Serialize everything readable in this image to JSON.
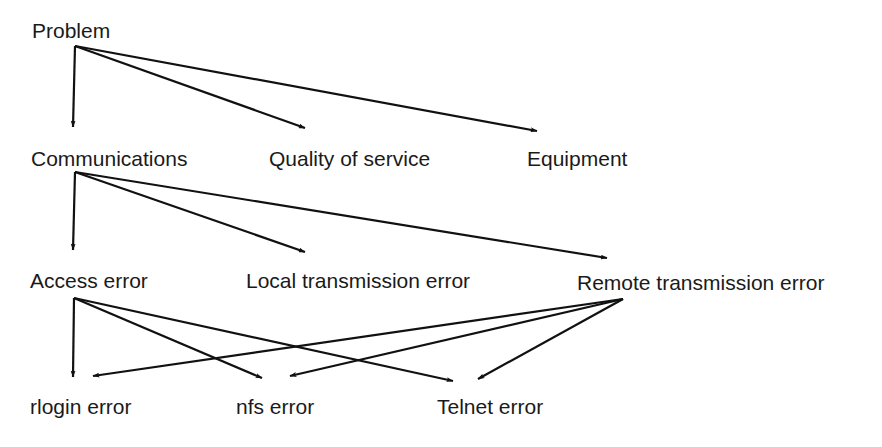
{
  "diagram": {
    "type": "hierarchy",
    "colors": {
      "background": "#ffffff",
      "line": "#111111",
      "text": "#1a1a1a"
    },
    "nodes": [
      {
        "id": "problem",
        "label": "Problem",
        "x": 32,
        "y": 20
      },
      {
        "id": "communications",
        "label": "Communications",
        "x": 31,
        "y": 148
      },
      {
        "id": "quality",
        "label": "Quality of service",
        "x": 269,
        "y": 148
      },
      {
        "id": "equipment",
        "label": "Equipment",
        "x": 527,
        "y": 148
      },
      {
        "id": "access",
        "label": "Access error",
        "x": 30,
        "y": 270
      },
      {
        "id": "local",
        "label": "Local transmission error",
        "x": 246,
        "y": 270
      },
      {
        "id": "remote",
        "label": "Remote transmission error",
        "x": 577,
        "y": 272
      },
      {
        "id": "rlogin",
        "label": "rlogin error",
        "x": 30,
        "y": 396
      },
      {
        "id": "nfs",
        "label": "nfs error",
        "x": 236,
        "y": 396
      },
      {
        "id": "telnet",
        "label": "Telnet error",
        "x": 437,
        "y": 396
      }
    ],
    "edges": [
      {
        "from": "problem",
        "to": "communications",
        "x1": 75,
        "y1": 46,
        "x2": 73,
        "y2": 127
      },
      {
        "from": "problem",
        "to": "quality",
        "x1": 75,
        "y1": 46,
        "x2": 305,
        "y2": 128
      },
      {
        "from": "problem",
        "to": "equipment",
        "x1": 75,
        "y1": 46,
        "x2": 537,
        "y2": 131
      },
      {
        "from": "communications",
        "to": "access",
        "x1": 75,
        "y1": 172,
        "x2": 73,
        "y2": 250
      },
      {
        "from": "communications",
        "to": "local",
        "x1": 75,
        "y1": 172,
        "x2": 305,
        "y2": 252
      },
      {
        "from": "communications",
        "to": "remote",
        "x1": 75,
        "y1": 172,
        "x2": 607,
        "y2": 258
      },
      {
        "from": "access",
        "to": "rlogin",
        "x1": 74,
        "y1": 298,
        "x2": 73,
        "y2": 377
      },
      {
        "from": "access",
        "to": "nfs",
        "x1": 74,
        "y1": 298,
        "x2": 262,
        "y2": 378
      },
      {
        "from": "access",
        "to": "telnet",
        "x1": 74,
        "y1": 298,
        "x2": 453,
        "y2": 381
      },
      {
        "from": "remote",
        "to": "rlogin",
        "x1": 623,
        "y1": 299,
        "x2": 93,
        "y2": 376
      },
      {
        "from": "remote",
        "to": "nfs",
        "x1": 623,
        "y1": 299,
        "x2": 290,
        "y2": 376
      },
      {
        "from": "remote",
        "to": "telnet",
        "x1": 623,
        "y1": 299,
        "x2": 478,
        "y2": 379
      }
    ]
  }
}
